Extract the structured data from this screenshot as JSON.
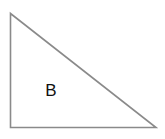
{
  "diagram": {
    "shape": "right-triangle",
    "label": "B",
    "stroke_color": "#8a8a8a",
    "fill_color": "#ffffff",
    "label_color": "#111111",
    "vertices": {
      "top": [
        10,
        13
      ],
      "bottom_left": [
        10,
        127
      ],
      "bottom_right": [
        156,
        127
      ]
    }
  }
}
